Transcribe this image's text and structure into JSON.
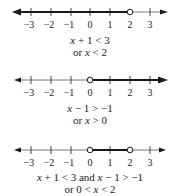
{
  "axis": {
    "ticks": [
      -3,
      -2,
      -1,
      0,
      1,
      2,
      3
    ],
    "tick_labels": [
      "−3",
      "−2",
      "−1",
      "0",
      "1",
      "2",
      "3"
    ]
  },
  "colors": {
    "line": "#1a1a1a",
    "thin_line": "#555555",
    "background": "#ffffff"
  },
  "panels": [
    {
      "id": "panel-1",
      "shaded": {
        "from": "-inf",
        "to": 2,
        "left_open_circle": null,
        "right_open_circle": 2
      },
      "caption_line1": {
        "parts": [
          "x",
          " + 1 < 3"
        ]
      },
      "caption_line2": {
        "parts": [
          "or ",
          "x",
          " < 2"
        ]
      }
    },
    {
      "id": "panel-2",
      "shaded": {
        "from": 0,
        "to": "inf",
        "left_open_circle": 0,
        "right_open_circle": null
      },
      "caption_line1": {
        "parts": [
          "x",
          " − 1 > −1"
        ]
      },
      "caption_line2": {
        "parts": [
          "or ",
          "x",
          " > 0"
        ]
      }
    },
    {
      "id": "panel-3",
      "shaded": {
        "from": 0,
        "to": 2,
        "left_open_circle": 0,
        "right_open_circle": 2
      },
      "caption_line1": {
        "parts": [
          "x",
          " + 1 < 3 and ",
          "x",
          " − 1 > −1"
        ]
      },
      "caption_line2": {
        "parts": [
          "or 0 < ",
          "x",
          " < 2"
        ]
      }
    }
  ]
}
